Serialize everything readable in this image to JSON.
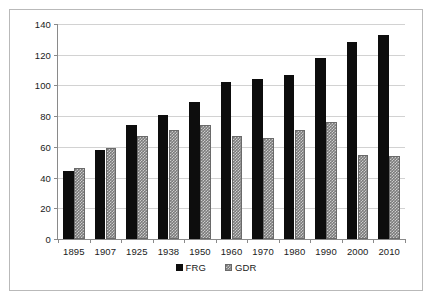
{
  "chart_data": {
    "type": "bar",
    "title": "",
    "subtitle": "",
    "xlabel": "",
    "ylabel": "",
    "categories": [
      "1895",
      "1907",
      "1925",
      "1938",
      "1950",
      "1960",
      "1970",
      "1980",
      "1990",
      "2000",
      "2010"
    ],
    "series": [
      {
        "name": "FRG",
        "color": "#0d0d0d",
        "values": [
          44,
          58,
          74,
          81,
          89,
          102,
          104,
          107,
          118,
          128,
          133
        ]
      },
      {
        "name": "GDR",
        "color": "#7b7b7b",
        "values": [
          46,
          59,
          67,
          71,
          74,
          67,
          66,
          71,
          76,
          55,
          54
        ]
      }
    ],
    "ylim": [
      0,
      140
    ],
    "yticks": [
      0,
      20,
      40,
      60,
      80,
      100,
      120,
      140
    ],
    "ytick_labels": [
      "0",
      "20",
      "40",
      "60",
      "80",
      "100",
      "120",
      "140"
    ],
    "grid": true,
    "grid_axis": "y",
    "legend_position": "bottom",
    "legend_entries": [
      "FRG",
      "GDR"
    ],
    "plot_background": "#ffffff",
    "frame_border_color": "#b9b9b9",
    "axis_color": "#8a8a8a",
    "gridline_color": "#d2d2d2"
  }
}
